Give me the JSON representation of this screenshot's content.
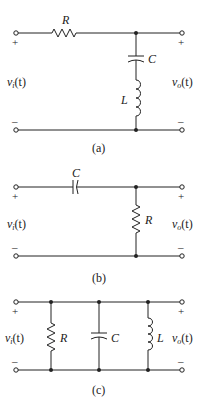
{
  "circuits": [
    {
      "id": "a",
      "caption": "(a)",
      "series_label": "R",
      "shunt_labels": [
        "C",
        "L"
      ],
      "input_label": "v",
      "input_sub": "i",
      "output_label": "v",
      "output_sub": "o",
      "arg": "(t)",
      "plus": "+",
      "minus": "–"
    },
    {
      "id": "b",
      "caption": "(b)",
      "series_label": "C",
      "shunt_labels": [
        "R"
      ],
      "input_label": "v",
      "input_sub": "i",
      "output_label": "v",
      "output_sub": "o",
      "arg": "(t)",
      "plus": "+",
      "minus": "–"
    },
    {
      "id": "c",
      "caption": "(c)",
      "shunt_labels": [
        "R",
        "C",
        "L"
      ],
      "input_label": "v",
      "input_sub": "i",
      "output_label": "v",
      "output_sub": "o",
      "arg": "(t)",
      "plus": "+",
      "minus": "–"
    }
  ]
}
